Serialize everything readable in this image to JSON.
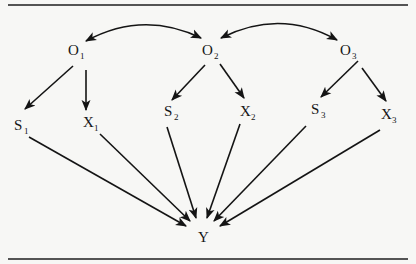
{
  "diagram": {
    "type": "path-diagram",
    "nodes": [
      {
        "id": "O1",
        "label": "O",
        "sub": "1",
        "x": 76,
        "y": 54
      },
      {
        "id": "O2",
        "label": "O",
        "sub": "2",
        "x": 210,
        "y": 54
      },
      {
        "id": "O3",
        "label": "O",
        "sub": "3",
        "x": 347,
        "y": 54
      },
      {
        "id": "S1",
        "label": "S",
        "sub": "1",
        "x": 20,
        "y": 130
      },
      {
        "id": "X1",
        "label": "X",
        "sub": "1",
        "x": 89,
        "y": 130
      },
      {
        "id": "S2",
        "label": "S",
        "sub": "2",
        "x": 166,
        "y": 118
      },
      {
        "id": "X2",
        "label": "X",
        "sub": "2",
        "x": 246,
        "y": 118
      },
      {
        "id": "S3",
        "label": "S",
        "sub": "3",
        "x": 315,
        "y": 115
      },
      {
        "id": "X3",
        "label": "X",
        "sub": "3",
        "x": 388,
        "y": 119
      },
      {
        "id": "Y",
        "label": "Y",
        "sub": "",
        "x": 203,
        "y": 243
      }
    ],
    "correlations": [
      {
        "from": "O1",
        "to": "O2",
        "bidirectional": true
      },
      {
        "from": "O2",
        "to": "O3",
        "bidirectional": true
      }
    ],
    "edges": [
      {
        "from": "O1",
        "to": "S1"
      },
      {
        "from": "O1",
        "to": "X1"
      },
      {
        "from": "O2",
        "to": "S2"
      },
      {
        "from": "O2",
        "to": "X2"
      },
      {
        "from": "O3",
        "to": "S3"
      },
      {
        "from": "O3",
        "to": "X3"
      },
      {
        "from": "S1",
        "to": "Y"
      },
      {
        "from": "X1",
        "to": "Y"
      },
      {
        "from": "S2",
        "to": "Y"
      },
      {
        "from": "X2",
        "to": "Y"
      },
      {
        "from": "S3",
        "to": "Y"
      },
      {
        "from": "X3",
        "to": "Y"
      }
    ]
  },
  "labels": {
    "O1": {
      "main": "O",
      "sub": "1"
    },
    "O2": {
      "main": "O",
      "sub": "2"
    },
    "O3": {
      "main": "O",
      "sub": "3"
    },
    "S1": {
      "main": "S",
      "sub": "1"
    },
    "X1": {
      "main": "X",
      "sub": "1"
    },
    "S2": {
      "main": "S",
      "sub": "2"
    },
    "X2": {
      "main": "X",
      "sub": "2"
    },
    "S3": {
      "main": "S",
      "sub": "3"
    },
    "X3": {
      "main": "X",
      "sub": "3"
    },
    "Y": {
      "main": "Y",
      "sub": ""
    }
  },
  "colors": {
    "background": "#f7f7f5",
    "ink": "#141414"
  }
}
